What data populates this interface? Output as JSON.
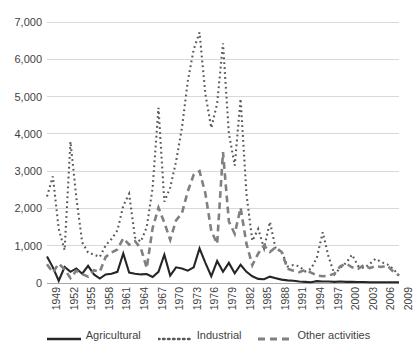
{
  "chart_data": {
    "type": "line",
    "title": "",
    "subtitle": "",
    "xlabel": "",
    "ylabel": "",
    "xlim": [
      1949,
      2009
    ],
    "ylim": [
      0,
      7000
    ],
    "grid": true,
    "legend_position": "bottom",
    "y_ticks": [
      0,
      1000,
      2000,
      3000,
      4000,
      5000,
      6000,
      7000
    ],
    "y_tick_labels": [
      "0",
      "1,000",
      "2,000",
      "3,000",
      "4,000",
      "5,000",
      "6,000",
      "7,000"
    ],
    "x_tick_labels": [
      "1949",
      "1952",
      "1955",
      "1958",
      "1961",
      "1964",
      "1967",
      "1970",
      "1973",
      "1976",
      "1979",
      "1982",
      "1985",
      "1988",
      "1991",
      "1994",
      "1997",
      "2000",
      "2003",
      "2006",
      "2009"
    ],
    "x": [
      1949,
      1950,
      1951,
      1952,
      1953,
      1954,
      1955,
      1956,
      1957,
      1958,
      1959,
      1960,
      1961,
      1962,
      1963,
      1964,
      1965,
      1966,
      1967,
      1968,
      1969,
      1970,
      1971,
      1972,
      1973,
      1974,
      1975,
      1976,
      1977,
      1978,
      1979,
      1980,
      1981,
      1982,
      1983,
      1984,
      1985,
      1986,
      1987,
      1988,
      1989,
      1990,
      1991,
      1992,
      1993,
      1994,
      1995,
      1996,
      1997,
      1998,
      1999,
      2000,
      2001,
      2002,
      2003,
      2004,
      2005,
      2006,
      2007,
      2008,
      2009
    ],
    "series": [
      {
        "name": "Agricultural",
        "style": "solid",
        "color": "#262626",
        "width": 2.1,
        "values": [
          710,
          420,
          60,
          430,
          300,
          390,
          250,
          460,
          230,
          120,
          230,
          250,
          300,
          790,
          280,
          250,
          230,
          240,
          160,
          300,
          760,
          200,
          420,
          390,
          330,
          420,
          930,
          540,
          180,
          590,
          300,
          540,
          260,
          490,
          300,
          180,
          110,
          100,
          170,
          130,
          90,
          70,
          60,
          40,
          30,
          20,
          50,
          40,
          40,
          30,
          40,
          30,
          30,
          25,
          25,
          20,
          20,
          20,
          20,
          20,
          20
        ]
      },
      {
        "name": "Industrial",
        "style": "dotted",
        "color": "#595959",
        "width": 2.1,
        "values": [
          2320,
          2860,
          1450,
          880,
          3790,
          2290,
          1090,
          820,
          760,
          700,
          1010,
          1180,
          1410,
          2070,
          2390,
          1220,
          1110,
          1500,
          2540,
          4700,
          2180,
          2560,
          3260,
          4160,
          5410,
          6260,
          6720,
          5060,
          4160,
          4810,
          6430,
          4010,
          3150,
          4940,
          2380,
          1130,
          1450,
          930,
          1640,
          900,
          850,
          440,
          480,
          450,
          310,
          380,
          680,
          1360,
          700,
          230,
          410,
          540,
          760,
          460,
          400,
          510,
          650,
          560,
          500,
          380,
          200
        ]
      },
      {
        "name": "Other activities",
        "style": "dashed",
        "color": "#808080",
        "width": 2.6,
        "values": [
          500,
          280,
          520,
          370,
          130,
          330,
          240,
          170,
          340,
          300,
          700,
          820,
          900,
          1200,
          1030,
          1120,
          930,
          400,
          1470,
          2020,
          1620,
          1160,
          1680,
          1870,
          2460,
          2900,
          3000,
          2400,
          1400,
          1050,
          3510,
          1650,
          1320,
          2020,
          1050,
          480,
          790,
          1010,
          830,
          960,
          830,
          380,
          330,
          290,
          350,
          280,
          200,
          180,
          200,
          250,
          450,
          520,
          420,
          380,
          480,
          400,
          450,
          430,
          470,
          310,
          200
        ]
      }
    ]
  },
  "legend": {
    "items": [
      {
        "label": "Agricultural",
        "style": "solid"
      },
      {
        "label": "Industrial",
        "style": "dotted"
      },
      {
        "label": "Other activities",
        "style": "dashed"
      }
    ]
  }
}
